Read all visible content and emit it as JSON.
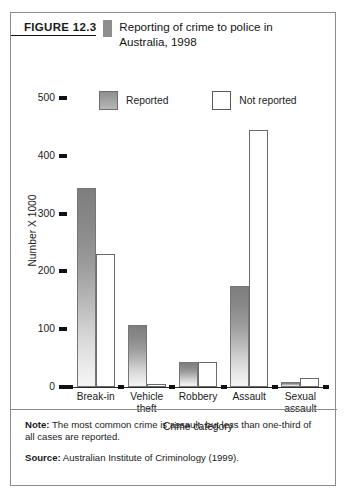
{
  "figure": {
    "number_label": "FIGURE 12.3",
    "title": "Reporting of crime to police in Australia, 1998"
  },
  "footer": {
    "note_tag": "Note:",
    "note_text": " The most common crime is assault, but less than one-third of all cases are reported.",
    "source_tag": "Source:",
    "source_text": " Australian Institute of Criminology (1999)."
  },
  "chart_data": {
    "type": "bar",
    "title": "Reporting of crime to police in Australia, 1998",
    "xlabel": "Crime category",
    "ylabel": "Number X 1000",
    "categories": [
      "Break-in",
      "Vehicle theft",
      "Robbery",
      "Assault",
      "Sexual assault"
    ],
    "series": [
      {
        "name": "Reported",
        "values": [
          345,
          107,
          43,
          175,
          8
        ],
        "color": "#9b9b9b"
      },
      {
        "name": "Not reported",
        "values": [
          230,
          5,
          43,
          445,
          16
        ],
        "color": "#ffffff"
      }
    ],
    "ylim": [
      0,
      500
    ],
    "yticks": [
      0,
      100,
      200,
      300,
      400,
      500
    ],
    "ytick_labels": [
      "0",
      "100",
      "200",
      "300",
      "400",
      "500"
    ],
    "grid": false,
    "legend_position": "top-center",
    "legend": [
      "Reported",
      "Not reported"
    ]
  }
}
